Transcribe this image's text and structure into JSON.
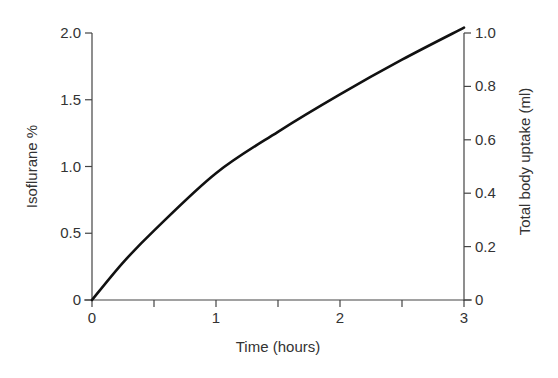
{
  "chart_data": {
    "type": "line",
    "title": "",
    "xlabel": "Time (hours)",
    "ylabel": "Isoflurane %",
    "y2label": "Total body uptake (ml)",
    "xlim": [
      0,
      3
    ],
    "ylim": [
      0,
      2.0
    ],
    "y2lim": [
      0,
      1.0
    ],
    "grid": false,
    "legend": "none",
    "x_ticks": [
      0,
      0.5,
      1,
      1.5,
      2,
      2.5,
      3
    ],
    "x_tick_labels": [
      "0",
      "",
      "1",
      "",
      "2",
      "",
      "3"
    ],
    "y_ticks": [
      0,
      0.5,
      1.0,
      1.5,
      2.0
    ],
    "y_tick_labels": [
      "0",
      "0.5",
      "1.0",
      "1.5",
      "2.0"
    ],
    "y2_ticks": [
      0,
      0.2,
      0.4,
      0.6,
      0.8,
      1.0
    ],
    "y2_tick_labels": [
      "0",
      "0.2",
      "0.4",
      "0.6",
      "0.8",
      "1.0"
    ],
    "series": [
      {
        "name": "Uptake curve",
        "color": "#111111",
        "x": [
          0,
          0.25,
          0.5,
          1.0,
          1.5,
          2.0,
          2.5,
          3.0
        ],
        "y": [
          0,
          0.28,
          0.52,
          0.95,
          1.26,
          1.54,
          1.8,
          2.04
        ]
      }
    ]
  }
}
